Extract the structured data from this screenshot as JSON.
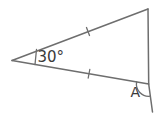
{
  "diagram": {
    "type": "geometry-triangle",
    "labels": {
      "apex_angle": "30°",
      "exterior_angle": "A"
    },
    "colors": {
      "background": "#ffffff",
      "line": "#6e6e6e",
      "text": "#3a3a3a"
    }
  }
}
